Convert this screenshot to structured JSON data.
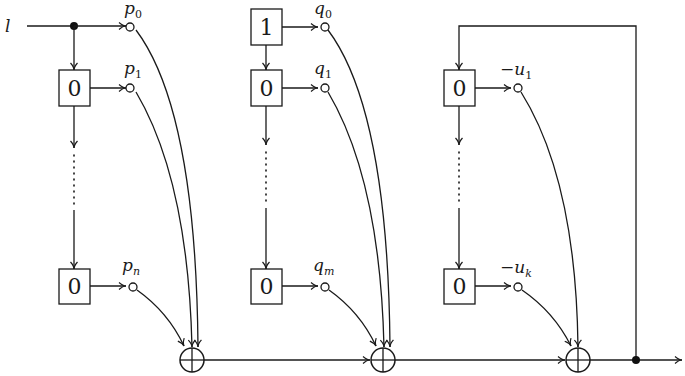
{
  "diagram": {
    "title": "",
    "input_label": "l",
    "colors": {
      "stroke": "#1a1a1a",
      "background": "#ffffff"
    },
    "columns": [
      {
        "name": "p-register",
        "boxes": [
          {
            "position": "top",
            "value": "0"
          },
          {
            "position": "bottom",
            "value": "0"
          }
        ],
        "taps": [
          {
            "label_base": "p",
            "label_sub": "0"
          },
          {
            "label_base": "p",
            "label_sub": "1"
          },
          {
            "label_base": "p",
            "label_sub": "n"
          }
        ]
      },
      {
        "name": "q-register",
        "boxes": [
          {
            "position": "initial",
            "value": "1"
          },
          {
            "position": "top",
            "value": "0"
          },
          {
            "position": "bottom",
            "value": "0"
          }
        ],
        "taps": [
          {
            "label_base": "q",
            "label_sub": "0"
          },
          {
            "label_base": "q",
            "label_sub": "1"
          },
          {
            "label_base": "q",
            "label_sub": "m"
          }
        ]
      },
      {
        "name": "u-register",
        "boxes": [
          {
            "position": "top",
            "value": "0"
          },
          {
            "position": "bottom",
            "value": "0"
          }
        ],
        "taps": [
          {
            "label_base": "−u",
            "label_sub": "1"
          },
          {
            "label_base": "−u",
            "label_sub": "k"
          }
        ]
      }
    ],
    "adders": [
      {
        "symbol": "⊕",
        "name": "adder-1"
      },
      {
        "symbol": "⊕",
        "name": "adder-2"
      },
      {
        "symbol": "⊕",
        "name": "adder-3"
      }
    ],
    "ellipsis": "vertical dotted continuation between first and last register cells",
    "feedback": "output of third adder fed back to top of u-register"
  }
}
